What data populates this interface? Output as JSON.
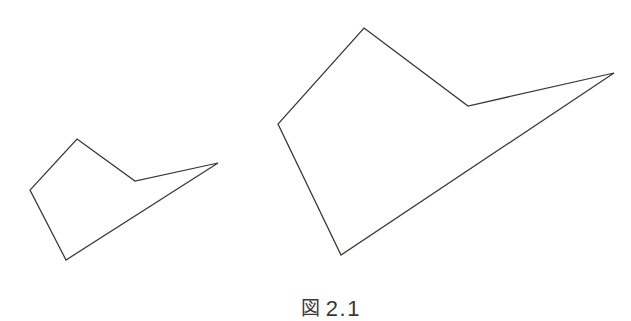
{
  "figure": {
    "caption_label": "図",
    "caption_number": "2.1",
    "caption_full": "図 2.1",
    "background_color": "#ffffff",
    "stroke_color": "#3a3733",
    "stroke_width": 1.25,
    "canvas": {
      "width": 631,
      "height": 309
    }
  },
  "chart_data": {
    "type": "scatter",
    "xlabel": "",
    "ylabel": "",
    "grid": false,
    "legend": "none",
    "xlim": [
      0,
      631
    ],
    "ylim": [
      309,
      0
    ],
    "series": [
      {
        "name": "small-polygon",
        "closed": true,
        "vertex_count": 6,
        "x": [
          77,
          135,
          218,
          66,
          30,
          77
        ],
        "y": [
          139,
          181,
          163,
          260,
          190,
          139
        ],
        "points": [
          [
            77,
            139
          ],
          [
            135,
            181
          ],
          [
            218,
            163
          ],
          [
            66,
            260
          ],
          [
            30,
            190
          ],
          [
            77,
            139
          ]
        ]
      },
      {
        "name": "large-polygon",
        "closed": true,
        "vertex_count": 6,
        "x": [
          364,
          468,
          614,
          341,
          278,
          364
        ],
        "y": [
          28,
          106,
          73,
          255,
          124,
          28
        ],
        "points": [
          [
            364,
            28
          ],
          [
            468,
            106
          ],
          [
            614,
            73
          ],
          [
            341,
            255
          ],
          [
            278,
            124
          ],
          [
            364,
            28
          ]
        ]
      }
    ]
  }
}
